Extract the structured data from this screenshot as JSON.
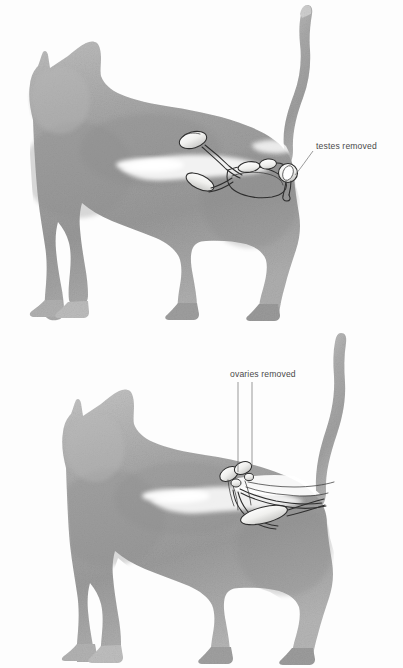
{
  "page": {
    "background_color": "#fdfdfd",
    "width": 403,
    "height": 668
  },
  "figures": [
    {
      "id": "male-cat",
      "subject": "male cat silhouette, standing, tail raised",
      "label": "testes removed",
      "label_color": "#4a4a4a",
      "body_color": "#9a9a9a",
      "leader_lines": 1,
      "organs": [
        "kidney",
        "bladder",
        "ductus deferens",
        "prostate",
        "penis",
        "testis"
      ]
    },
    {
      "id": "female-cat",
      "subject": "female cat silhouette, standing, tail raised",
      "label": "ovaries  removed",
      "label_color": "#4a4a4a",
      "body_color": "#9a9a9a",
      "leader_lines": 2,
      "organs": [
        "kidney",
        "ovary",
        "uterine horn",
        "uterus",
        "bladder",
        "vagina"
      ]
    }
  ],
  "colors": {
    "background": "#fdfdfd",
    "cat_body_light": "#b9b9b9",
    "cat_body_mid": "#9d9d9d",
    "cat_body_dark": "#868686",
    "organ_fill": "#f2f2f0",
    "organ_stroke": "#2e2e2e",
    "leader_stroke": "#6e6e6e",
    "text": "#4a4a4a"
  }
}
